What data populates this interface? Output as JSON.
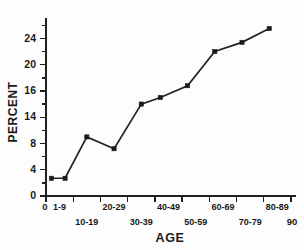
{
  "chart_data": {
    "type": "line",
    "title": "",
    "subtitle": "",
    "xlabel": "AGE",
    "ylabel": "PERCENT",
    "xlim": [
      0,
      90
    ],
    "ylim": [
      0,
      26.5
    ],
    "grid": false,
    "legend": null,
    "marker": "square",
    "line_color": "#222222",
    "marker_color": "#1b1b1b",
    "background_color": "#fdfdfd",
    "y_ticks": [
      {
        "label": "0",
        "value": 0
      },
      {
        "label": "4",
        "value": 4
      },
      {
        "label": "8",
        "value": 8
      },
      {
        "label": "14",
        "value": 12
      },
      {
        "label": "16",
        "value": 16
      },
      {
        "label": "20",
        "value": 20
      },
      {
        "label": "24",
        "value": 24
      }
    ],
    "x_axis_end_labels": [
      {
        "label": "0",
        "value": 0,
        "row": "upper"
      },
      {
        "label": "90",
        "value": 90,
        "row": "lower"
      }
    ],
    "x_group_labels": [
      {
        "label": "1-9",
        "center": 5,
        "row": "upper"
      },
      {
        "label": "10-19",
        "center": 15,
        "row": "lower"
      },
      {
        "label": "20-29",
        "center": 25,
        "row": "upper"
      },
      {
        "label": "30-39",
        "center": 35,
        "row": "lower"
      },
      {
        "label": "40-49",
        "center": 45,
        "row": "upper"
      },
      {
        "label": "50-59",
        "center": 55,
        "row": "lower"
      },
      {
        "label": "60-69",
        "center": 65,
        "row": "upper"
      },
      {
        "label": "70-79",
        "center": 75,
        "row": "lower"
      },
      {
        "label": "80-89",
        "center": 85,
        "row": "upper"
      }
    ],
    "x_tick_values": [
      0,
      10,
      20,
      30,
      40,
      50,
      60,
      70,
      80,
      90
    ],
    "categories": [
      "1-9",
      "1-9",
      "10-19",
      "20-29",
      "30-39",
      "40-49",
      "50-59",
      "60-69",
      "70-79",
      "80-89"
    ],
    "x": [
      2,
      7,
      15,
      25,
      35,
      42,
      52,
      62,
      72,
      82
    ],
    "values": [
      2.7,
      2.7,
      9.0,
      7.2,
      14.0,
      15.0,
      16.8,
      22.0,
      23.4,
      25.5
    ],
    "series": [
      {
        "name": "Percent",
        "x": [
          2,
          7,
          15,
          25,
          35,
          42,
          52,
          62,
          72,
          82
        ],
        "values": [
          2.7,
          2.7,
          9.0,
          7.2,
          14.0,
          15.0,
          16.8,
          22.0,
          23.4,
          25.5
        ]
      }
    ],
    "annotations": []
  }
}
